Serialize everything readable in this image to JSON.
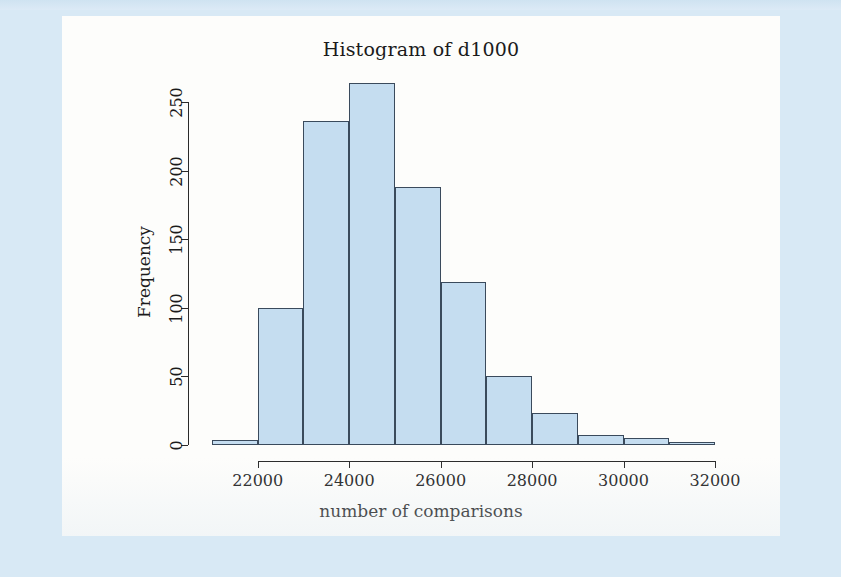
{
  "figure": {
    "title": "Histogram of d1000",
    "x_axis_title": "number of comparisons",
    "y_axis_title": "Frequency",
    "bar_fill_color": "#c5ddf0",
    "bar_border_color": "#3a4a5c",
    "panel_background": "#fdfdfb",
    "page_background": "#d8e9f5"
  },
  "chart_data": {
    "type": "bar",
    "title": "Histogram of d1000",
    "xlabel": "number of comparisons",
    "ylabel": "Frequency",
    "xlim": [
      21000,
      32000
    ],
    "ylim": [
      0,
      270
    ],
    "grid": false,
    "legend": false,
    "bin_width": 1000,
    "bin_edges": [
      21000,
      22000,
      23000,
      24000,
      25000,
      26000,
      27000,
      28000,
      29000,
      30000,
      31000,
      32000
    ],
    "categories": [
      "21000-22000",
      "22000-23000",
      "23000-24000",
      "24000-25000",
      "25000-26000",
      "26000-27000",
      "27000-28000",
      "28000-29000",
      "29000-30000",
      "30000-31000",
      "31000-32000"
    ],
    "values": [
      4,
      100,
      236,
      264,
      188,
      119,
      50,
      23,
      7,
      5,
      1
    ],
    "x_ticks": [
      22000,
      24000,
      26000,
      28000,
      30000,
      32000
    ],
    "x_tick_labels": [
      "22000",
      "24000",
      "26000",
      "28000",
      "30000",
      "32000"
    ],
    "y_ticks": [
      0,
      50,
      100,
      150,
      200,
      250
    ],
    "y_tick_labels": [
      "0",
      "50",
      "100",
      "150",
      "200",
      "250"
    ]
  }
}
